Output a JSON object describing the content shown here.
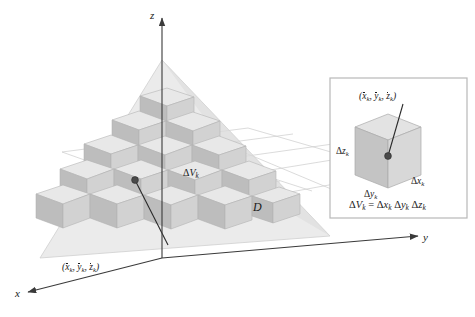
{
  "figure": {
    "type": "math-diagram",
    "background_color": "#ffffff"
  },
  "axes": {
    "z": {
      "label": "z",
      "position": "top"
    },
    "y": {
      "label": "y",
      "position": "right"
    },
    "x": {
      "label": "x",
      "position": "bottom-left"
    },
    "color": "#3a3a3a"
  },
  "main": {
    "region_label": "D",
    "cell_label": {
      "delta": "Δ",
      "v": "V",
      "sub": "k"
    },
    "point_label": {
      "open": "(",
      "x": "x",
      "y": "y",
      "z": "z",
      "sub": "k",
      "comma": ", ",
      "close": ")"
    },
    "solid_fill": "#dcdcdc",
    "grid_color": "#c9c9c9",
    "cube_top": "#e8e8e8",
    "cube_left": "#bdbdbd",
    "cube_right": "#d4d4d4"
  },
  "inset": {
    "border_color": "#b8b8b8",
    "background": "#ffffff",
    "point_label": {
      "open": "(",
      "x": "x",
      "y": "y",
      "z": "z",
      "sub": "k",
      "comma": ", ",
      "close": ")"
    },
    "dim_z": {
      "delta": "Δ",
      "var": "z",
      "sub": "k"
    },
    "dim_y": {
      "delta": "Δ",
      "var": "y",
      "sub": "k"
    },
    "dim_x": {
      "delta": "Δ",
      "var": "x",
      "sub": "k"
    },
    "formula": {
      "lhs_delta": "Δ",
      "lhs_var": "V",
      "lhs_sub": "k",
      "equals": "=",
      "t1_delta": "Δ",
      "t1_var": "x",
      "t1_sub": "k",
      "t2_delta": "Δ",
      "t2_var": "y",
      "t2_sub": "k",
      "t3_delta": "Δ",
      "t3_var": "z",
      "t3_sub": "k"
    },
    "cube_top": "#e3e3e3",
    "cube_left": "#c4c4c4",
    "cube_right": "#d8d8d8"
  }
}
